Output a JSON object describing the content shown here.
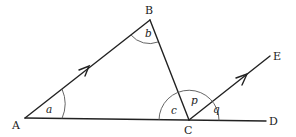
{
  "diagram": {
    "type": "geometry",
    "points": {
      "A": {
        "label": "A",
        "x": 25,
        "y": 118
      },
      "B": {
        "label": "B",
        "x": 150,
        "y": 20
      },
      "C": {
        "label": "C",
        "x": 189,
        "y": 120
      },
      "D": {
        "label": "D",
        "x": 266,
        "y": 121
      },
      "E": {
        "label": "E",
        "x": 270,
        "y": 56
      }
    },
    "angles": {
      "a": "a",
      "b": "b",
      "c": "c",
      "p": "p",
      "q": "q"
    },
    "parallel_marks": [
      "AB",
      "CE"
    ],
    "colors": {
      "line": "#222222",
      "arc": "#555555"
    }
  }
}
